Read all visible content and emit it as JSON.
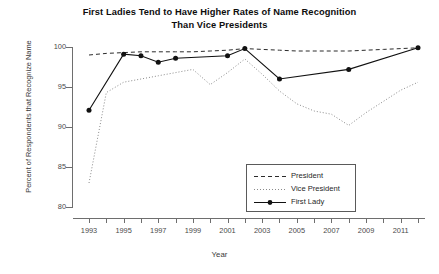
{
  "chart_data": {
    "type": "line",
    "title": "First Ladies Tend to Have Higher Rates of Name Recognition Than Vice Presidents",
    "title_line1": "First Ladies Tend to Have Higher Rates of Name Recognition",
    "title_line2": "Than Vice Presidents",
    "xlabel": "Year",
    "ylabel": "Percent of Respondents that Recognize Name",
    "xlim": [
      1993,
      2012
    ],
    "ylim": [
      80,
      100
    ],
    "yticks": [
      80,
      85,
      90,
      95,
      100
    ],
    "ytick_labels": [
      "80",
      "85",
      "90",
      "95",
      "100"
    ],
    "xticks": [
      1993,
      1994,
      1995,
      1996,
      1997,
      1998,
      1999,
      2000,
      2001,
      2002,
      2003,
      2004,
      2005,
      2006,
      2007,
      2008,
      2009,
      2010,
      2011,
      2012
    ],
    "xtick_labels_shown": [
      "1993",
      "1995",
      "1997",
      "1999",
      "2001",
      "2003",
      "2005",
      "2007",
      "2009",
      "2011"
    ],
    "grid": false,
    "legend_position": "bottom-right",
    "series": [
      {
        "name": "President",
        "style": "dashed",
        "markers": false,
        "color": "#2b2b2b",
        "x": [
          1993,
          1994,
          1995,
          1996,
          1997,
          1998,
          1999,
          2000,
          2001,
          2002,
          2003,
          2004,
          2005,
          2006,
          2007,
          2008,
          2009,
          2010,
          2011,
          2012
        ],
        "values": [
          99.0,
          99.2,
          99.3,
          99.4,
          99.4,
          99.4,
          99.4,
          99.5,
          99.6,
          99.8,
          99.7,
          99.6,
          99.5,
          99.5,
          99.5,
          99.5,
          99.6,
          99.7,
          99.8,
          99.9
        ]
      },
      {
        "name": "Vice President",
        "style": "dotted",
        "markers": false,
        "color": "#8a8a8a",
        "x": [
          1993,
          1994,
          1995,
          1996,
          1997,
          1998,
          1999,
          2000,
          2001,
          2002,
          2003,
          2004,
          2005,
          2006,
          2007,
          2008,
          2009,
          2010,
          2011,
          2012
        ],
        "values": [
          83.0,
          94.3,
          95.6,
          96.0,
          96.4,
          96.8,
          97.2,
          95.3,
          96.8,
          98.5,
          96.6,
          94.5,
          92.9,
          92.0,
          91.6,
          90.2,
          91.8,
          93.2,
          94.6,
          95.6
        ]
      },
      {
        "name": "First Lady",
        "style": "solid",
        "markers": true,
        "color": "#111111",
        "x": [
          1993,
          1995,
          1996,
          1997,
          1998,
          2001,
          2002,
          2004,
          2008,
          2012
        ],
        "values": [
          92.1,
          99.1,
          98.9,
          98.1,
          98.6,
          98.9,
          99.8,
          96.0,
          97.2,
          99.9
        ]
      }
    ]
  },
  "legend": {
    "items": [
      {
        "label": "President"
      },
      {
        "label": "Vice President"
      },
      {
        "label": "First Lady"
      }
    ]
  }
}
